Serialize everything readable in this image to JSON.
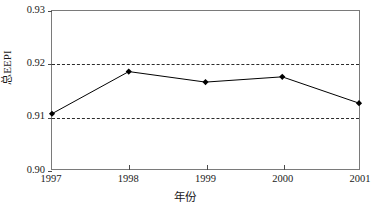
{
  "chart_data": {
    "type": "line",
    "title": "",
    "xlabel": "年份",
    "ylabel": "总EEPI",
    "categories": [
      "1997",
      "1998",
      "1999",
      "2000",
      "2001"
    ],
    "x": [
      1997,
      1998,
      1999,
      2000,
      2001
    ],
    "series": [
      {
        "name": "总EEPI",
        "values": [
          0.9105,
          0.9185,
          0.9165,
          0.9175,
          0.9125
        ],
        "marker": "diamond",
        "marker_color": "#000000",
        "line_color": "#000000",
        "line_width": 1
      }
    ],
    "ylim": [
      0.9,
      0.93
    ],
    "ytick_labels": [
      "0.90",
      "0.91",
      "0.92",
      "0.93"
    ],
    "ytick_values": [
      0.9,
      0.91,
      0.92,
      0.93
    ],
    "xtick_labels": [
      "1997",
      "1998",
      "1999",
      "2000",
      "2001"
    ],
    "gridlines": {
      "enabled": true,
      "style": "dashed",
      "color": "#2b2b2b",
      "at_values": [
        0.91,
        0.92
      ]
    },
    "legend": {
      "visible": false,
      "position": "none"
    },
    "frame": {
      "visible": true,
      "color": "#7a7a7a"
    },
    "background_color": "#ffffff"
  },
  "axis": {
    "y_title": "总EEPI",
    "x_title": "年份"
  }
}
